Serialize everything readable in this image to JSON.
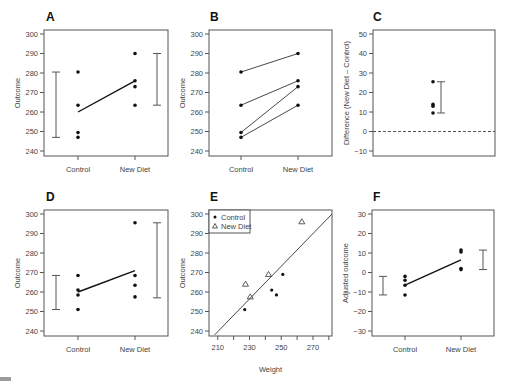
{
  "chart_data": [
    {
      "panel": "A",
      "type": "scatter",
      "title": "A",
      "xlabel": "",
      "ylabel": "Outcome",
      "categories": [
        "Control",
        "New Diet"
      ],
      "ylim": [
        238,
        302
      ],
      "yticks": [
        240,
        250,
        260,
        270,
        280,
        290,
        300
      ],
      "series": [
        {
          "name": "Control",
          "values": [
            280.5,
            263.5,
            249.5,
            247
          ]
        },
        {
          "name": "New Diet",
          "values": [
            290,
            276,
            273,
            263.5
          ]
        }
      ],
      "means": [
        260,
        276
      ],
      "ranges": [
        [
          247,
          280.5
        ],
        [
          263.5,
          290
        ]
      ]
    },
    {
      "panel": "B",
      "type": "line",
      "title": "B",
      "xlabel": "",
      "ylabel": "Outcome",
      "categories": [
        "Control",
        "New Diet"
      ],
      "ylim": [
        238,
        302
      ],
      "yticks": [
        240,
        250,
        260,
        270,
        280,
        290,
        300
      ],
      "pairs": [
        [
          280.5,
          290
        ],
        [
          263.5,
          276
        ],
        [
          249.5,
          273
        ],
        [
          247,
          263.5
        ]
      ]
    },
    {
      "panel": "C",
      "type": "scatter",
      "title": "C",
      "xlabel": "",
      "ylabel": "Difference (New Diet – Control)",
      "ylim": [
        -12,
        52
      ],
      "yticks": [
        -10,
        0,
        10,
        20,
        30,
        40,
        50
      ],
      "values": [
        25.5,
        14,
        13,
        9.5
      ],
      "range": [
        9.5,
        25.5
      ],
      "reference_line": 0
    },
    {
      "panel": "D",
      "type": "scatter",
      "title": "D",
      "xlabel": "",
      "ylabel": "Outcome",
      "categories": [
        "Control",
        "New Diet"
      ],
      "ylim": [
        238,
        302
      ],
      "yticks": [
        240,
        250,
        260,
        270,
        280,
        290,
        300
      ],
      "series": [
        {
          "name": "Control",
          "values": [
            268.5,
            261,
            258.5,
            251
          ]
        },
        {
          "name": "New Diet",
          "values": [
            295.5,
            268.5,
            263.5,
            257.5
          ]
        }
      ],
      "means": [
        260,
        271
      ],
      "ranges": [
        [
          251,
          268.5
        ],
        [
          257,
          295.5
        ]
      ]
    },
    {
      "panel": "E",
      "type": "scatter",
      "title": "E",
      "xlabel": "Weight",
      "ylabel": "Outcome",
      "xlim": [
        207,
        282
      ],
      "ylim": [
        238,
        302
      ],
      "xticks": [
        210,
        230,
        250,
        270
      ],
      "xticks_minor": [
        220,
        240,
        260,
        280
      ],
      "yticks": [
        240,
        250,
        260,
        270,
        280,
        290,
        300
      ],
      "legend": [
        "Control",
        "New Diet"
      ],
      "legend_position": "upper-left",
      "series": [
        {
          "name": "Control",
          "marker": "circle",
          "points": [
            [
              227,
              251
            ],
            [
              244,
              261
            ],
            [
              247,
              258.5
            ],
            [
              251,
              269
            ]
          ]
        },
        {
          "name": "New Diet",
          "marker": "triangle",
          "points": [
            [
              227.5,
              264
            ],
            [
              230.5,
              257.5
            ],
            [
              242,
              269
            ],
            [
              263,
              296
            ]
          ]
        }
      ],
      "fit_line": [
        [
          208,
          238
        ],
        [
          282,
          300
        ]
      ]
    },
    {
      "panel": "F",
      "type": "scatter",
      "title": "F",
      "xlabel": "",
      "ylabel": "Adjusted outcome",
      "categories": [
        "Control",
        "New Diet"
      ],
      "ylim": [
        -32,
        32
      ],
      "yticks": [
        -30,
        -20,
        -10,
        0,
        10,
        20,
        30
      ],
      "series": [
        {
          "name": "Control",
          "values": [
            -2,
            -4,
            -6.5,
            -11.5
          ]
        },
        {
          "name": "New Diet",
          "values": [
            11.5,
            10.5,
            2,
            1.5
          ]
        }
      ],
      "means": [
        -6.5,
        6.5
      ],
      "ranges": [
        [
          -11.5,
          -2
        ],
        [
          1.5,
          11.5
        ]
      ]
    }
  ],
  "labels": {
    "panel_a": "A",
    "panel_b": "B",
    "panel_c": "C",
    "panel_d": "D",
    "panel_e": "E",
    "panel_f": "F",
    "outcome": "Outcome",
    "difference": "Difference (New Diet – Control)",
    "adjusted": "Adjusted outcome",
    "weight": "Weight",
    "control": "Control",
    "new_diet": "New Diet",
    "legend_control": "Control",
    "legend_new_diet": "New Diet"
  }
}
